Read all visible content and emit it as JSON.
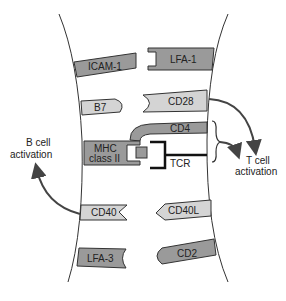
{
  "diagram": {
    "left_cell": "B cell",
    "right_cell": "T cell",
    "molecules": {
      "icam1": "ICAM-1",
      "lfa1": "LFA-1",
      "b7": "B7",
      "cd28": "CD28",
      "cd4": "CD4",
      "mhc_line1": "MHC",
      "mhc_line2": "class II",
      "tcr": "TCR",
      "cd40": "CD40",
      "cd40l": "CD40L",
      "lfa3": "LFA-3",
      "cd2": "CD2"
    },
    "outcomes": {
      "b_line1": "B cell",
      "b_line2": "activation",
      "t_line1": "T cell",
      "t_line2": "activation"
    },
    "colors": {
      "dark_molecule": "#9a9a9a",
      "light_molecule": "#d4d4d4",
      "outline": "#333333",
      "arrow": "#444444"
    }
  }
}
